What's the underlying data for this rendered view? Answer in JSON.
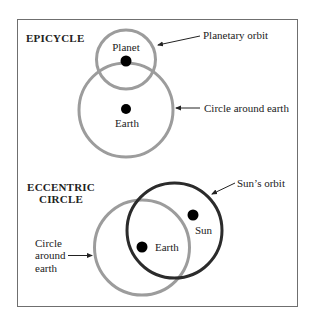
{
  "colors": {
    "frame": "#6f6f6f",
    "gray_circle": "#9c9c9c",
    "dark_circle": "#2b2b2b",
    "dot": "#000000",
    "text": "#222222"
  },
  "epicycle": {
    "title": "EPICYCLE",
    "planet_label": "Planet",
    "earth_label": "Earth",
    "planetary_orbit_label": "Planetary orbit",
    "circle_around_earth_label": "Circle around earth"
  },
  "eccentric": {
    "title_line1": "ECCENTRIC",
    "title_line2": "CIRCLE",
    "sun_label": "Sun",
    "earth_label": "Earth",
    "suns_orbit_label": "Sun’s orbit",
    "circle_around_earth_line1": "Circle",
    "circle_around_earth_line2": "around",
    "circle_around_earth_line3": "earth"
  }
}
